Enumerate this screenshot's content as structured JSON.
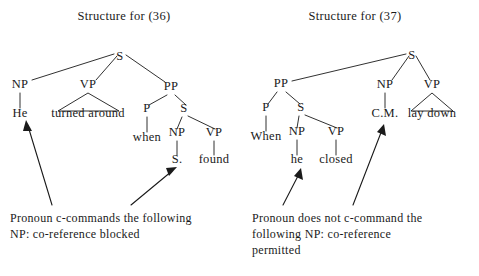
{
  "background_color": "#ffffff",
  "ink_color": "#1a1a1a",
  "figure": {
    "kind": "syntax-tree-pair",
    "panels": [
      {
        "id": "panel-36",
        "title": "Structure for (36)",
        "sentence": "He turned around when S. found",
        "nodes": [
          {
            "id": "S-root",
            "label": "S",
            "x": 120,
            "y": 60
          },
          {
            "id": "NP-subj",
            "label": "NP",
            "x": 20,
            "y": 88
          },
          {
            "id": "VP-main",
            "label": "VP",
            "x": 88,
            "y": 88
          },
          {
            "id": "PP",
            "label": "PP",
            "x": 171,
            "y": 90
          },
          {
            "id": "P",
            "label": "P",
            "x": 147,
            "y": 112
          },
          {
            "id": "S-emb",
            "label": "S",
            "x": 184,
            "y": 112
          },
          {
            "id": "NP-emb",
            "label": "NP",
            "x": 177,
            "y": 136
          },
          {
            "id": "VP-emb",
            "label": "VP",
            "x": 214,
            "y": 136
          }
        ],
        "leaves": [
          {
            "id": "leaf-he",
            "label": "He",
            "x": 20,
            "y": 117
          },
          {
            "id": "leaf-turned-around",
            "label": "turned around",
            "x": 88,
            "y": 117
          },
          {
            "id": "leaf-when",
            "label": "when",
            "x": 147,
            "y": 141
          },
          {
            "id": "leaf-sdot",
            "label": "S.",
            "x": 177,
            "y": 163
          },
          {
            "id": "leaf-found",
            "label": "found",
            "x": 214,
            "y": 163
          }
        ],
        "caption_lines": [
          "Pronoun c-commands the following",
          "NP: co-reference blocked"
        ],
        "caption_x": 10,
        "caption_y": 222,
        "arrow_targets": [
          "leaf-he",
          "leaf-sdot"
        ]
      },
      {
        "id": "panel-37",
        "title": "Structure for (37)",
        "sentence": "When he closed C.M. lay down",
        "nodes": [
          {
            "id": "S-root",
            "label": "S",
            "x": 412,
            "y": 59
          },
          {
            "id": "PP",
            "label": "PP",
            "x": 281,
            "y": 87
          },
          {
            "id": "NP-subj",
            "label": "NP",
            "x": 385,
            "y": 88
          },
          {
            "id": "VP-main",
            "label": "VP",
            "x": 432,
            "y": 88
          },
          {
            "id": "P",
            "label": "P",
            "x": 266,
            "y": 111
          },
          {
            "id": "S-emb",
            "label": "S",
            "x": 301,
            "y": 111
          },
          {
            "id": "NP-emb",
            "label": "NP",
            "x": 297,
            "y": 135
          },
          {
            "id": "VP-emb",
            "label": "VP",
            "x": 336,
            "y": 135
          }
        ],
        "leaves": [
          {
            "id": "leaf-when",
            "label": "When",
            "x": 266,
            "y": 140
          },
          {
            "id": "leaf-he",
            "label": "he",
            "x": 297,
            "y": 163
          },
          {
            "id": "leaf-closed",
            "label": "closed",
            "x": 336,
            "y": 163
          },
          {
            "id": "leaf-cm",
            "label": "C.M.",
            "x": 385,
            "y": 117
          },
          {
            "id": "leaf-lay-down",
            "label": "lay down",
            "x": 432,
            "y": 117
          }
        ],
        "caption_lines": [
          "Pronoun does not c-command the",
          "following NP: co-reference",
          "permitted"
        ],
        "caption_x": 252,
        "caption_y": 222,
        "arrow_targets": [
          "leaf-he",
          "leaf-cm"
        ]
      }
    ]
  }
}
